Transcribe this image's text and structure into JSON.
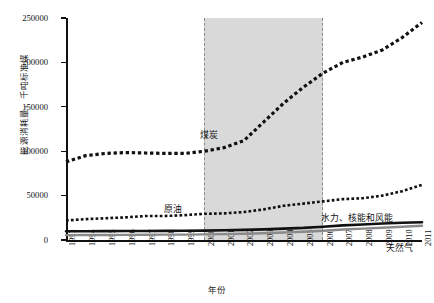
{
  "chart_data": {
    "type": "line",
    "title": "",
    "xlabel": "年份",
    "ylabel": "能源消耗量，千吨标准煤",
    "xlim": [
      1993,
      2011
    ],
    "ylim": [
      0,
      250000
    ],
    "grid": false,
    "legend_position": "inline-labels",
    "y_ticks": [
      0,
      50000,
      100000,
      150000,
      200000,
      250000
    ],
    "y_tick_labels": [
      "0",
      "50000",
      "100000",
      "150000",
      "200000",
      "250000"
    ],
    "x_ticks": [
      1993,
      1994,
      1995,
      1996,
      1997,
      1998,
      1999,
      2000,
      2001,
      2002,
      2003,
      2004,
      2005,
      2006,
      2007,
      2008,
      2009,
      2010,
      2011
    ],
    "x_tick_labels": [
      "1993",
      "1994",
      "1995",
      "1996",
      "1997",
      "1998",
      "1999",
      "2000",
      "2001",
      "2002",
      "2003",
      "2004",
      "2005",
      "2006",
      "2007",
      "2008",
      "2009",
      "2010",
      "2011"
    ],
    "categories": [
      1993,
      1994,
      1995,
      1996,
      1997,
      1998,
      1999,
      2000,
      2001,
      2002,
      2003,
      2004,
      2005,
      2006,
      2007,
      2008,
      2009,
      2010,
      2011
    ],
    "highlight_band": {
      "label": "2000-2006",
      "x_start": 2000,
      "x_end": 2006,
      "fill": "#d9d9d9",
      "border_style": "dashed",
      "border_color": "#8d8d8d"
    },
    "series": [
      {
        "name": "煤炭",
        "style": "dotted",
        "color": "#111111",
        "width": 3.2,
        "values": [
          88000,
          95000,
          97500,
          98500,
          98000,
          97500,
          97500,
          100000,
          104000,
          112000,
          133000,
          154000,
          172000,
          188000,
          200000,
          206000,
          214000,
          228000,
          245000
        ]
      },
      {
        "name": "原油",
        "style": "dotted",
        "color": "#111111",
        "width": 2.6,
        "values": [
          22000,
          23500,
          24500,
          25500,
          27000,
          27000,
          28000,
          29500,
          30000,
          31500,
          34500,
          38500,
          41000,
          43500,
          46000,
          47000,
          50000,
          55000,
          62000
        ]
      },
      {
        "name": "水力、核能和风能",
        "style": "solid",
        "color": "#111111",
        "width": 2.6,
        "values": [
          9800,
          9900,
          10000,
          10100,
          10200,
          10300,
          10400,
          10600,
          11000,
          11400,
          12000,
          12800,
          13600,
          15000,
          16500,
          17500,
          18500,
          19500,
          20000
        ]
      },
      {
        "name": "天然气",
        "style": "solid",
        "color": "#8a8a8a",
        "width": 2.4,
        "values": [
          5500,
          5600,
          5700,
          5800,
          5900,
          6000,
          6100,
          6300,
          6600,
          7000,
          7600,
          8400,
          9300,
          10500,
          11800,
          12800,
          13800,
          15000,
          16000
        ]
      }
    ],
    "annotations": [
      {
        "name": "coal-label",
        "text": "煤炭"
      },
      {
        "name": "oil-label",
        "text": "原油"
      },
      {
        "name": "renew-label",
        "text": "水力、核能和风能"
      },
      {
        "name": "gas-label",
        "text": "天然气"
      }
    ]
  }
}
